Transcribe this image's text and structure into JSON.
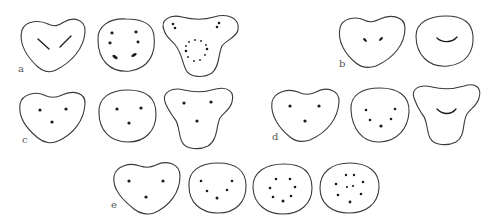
{
  "figure": {
    "panels": [
      {
        "label": "a",
        "shapes": [
          {
            "outline": "heart",
            "marks": "two oblique lines forming a V"
          },
          {
            "outline": "round",
            "marks": "six marks: two top, two middle, two elongated bottom"
          },
          {
            "outline": "trilobed",
            "marks": "two dot pairs in upper lobes and a dotted ring below"
          }
        ]
      },
      {
        "label": "b",
        "shapes": [
          {
            "outline": "heart",
            "marks": "two short oblique marks"
          },
          {
            "outline": "round",
            "marks": "smile-shaped curve"
          }
        ]
      },
      {
        "label": "c",
        "shapes": [
          {
            "outline": "heart",
            "marks": "three dots in a triangle"
          },
          {
            "outline": "round",
            "marks": "three dots in a triangle"
          },
          {
            "outline": "trilobed",
            "marks": "three dots in a triangle"
          }
        ]
      },
      {
        "label": "d",
        "shapes": [
          {
            "outline": "heart",
            "marks": "three dots in a triangle"
          },
          {
            "outline": "round",
            "marks": "five dots in a V arrangement"
          },
          {
            "outline": "trilobed",
            "marks": "smile-shaped curve"
          }
        ]
      },
      {
        "label": "e",
        "shapes": [
          {
            "outline": "heart",
            "marks": "three dots"
          },
          {
            "outline": "round",
            "marks": "five dots in a V"
          },
          {
            "outline": "round",
            "marks": "eight dots in a ring"
          },
          {
            "outline": "round",
            "marks": "ten dots: ring with two central dots"
          }
        ]
      }
    ]
  },
  "labels": {
    "a": "a",
    "b": "b",
    "c": "c",
    "d": "d",
    "e": "e"
  }
}
